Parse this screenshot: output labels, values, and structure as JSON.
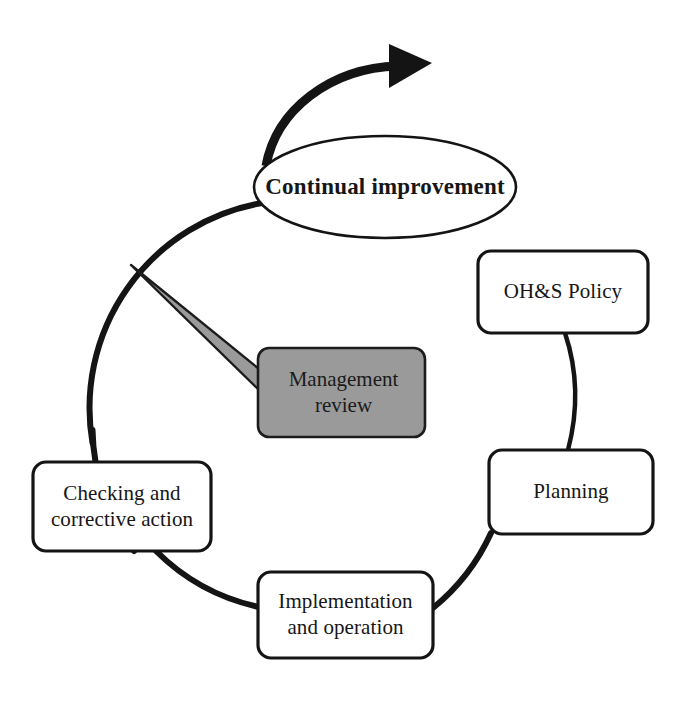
{
  "diagram": {
    "colors": {
      "stroke": "#141414",
      "box_fill": "#ffffff",
      "callout_fill": "#9a9a9a",
      "callout_stroke": "#1c1c1c",
      "page_background": "#ffffff",
      "text": "#161616"
    },
    "cycle_arrow": {
      "name": "continual-improvement-arrow",
      "direction": "clockwise"
    },
    "nodes": [
      {
        "id": "continual-improvement",
        "shape": "ellipse",
        "label": "Continual improvement",
        "emphasis": "bold",
        "x": 254,
        "y": 136,
        "width": 262,
        "height": 102
      },
      {
        "id": "ohs-policy",
        "shape": "rounded-rect",
        "label": "OH&S Policy",
        "x": 478,
        "y": 251,
        "width": 170,
        "height": 82
      },
      {
        "id": "planning",
        "shape": "rounded-rect",
        "label": "Planning",
        "x": 489,
        "y": 450,
        "width": 164,
        "height": 84
      },
      {
        "id": "implementation-and-operation",
        "shape": "rounded-rect",
        "label": "Implementation\nand operation",
        "x": 258,
        "y": 572,
        "width": 175,
        "height": 86
      },
      {
        "id": "checking-and-corrective-action",
        "shape": "rounded-rect",
        "label": "Checking and\ncorrective action",
        "x": 33,
        "y": 462,
        "width": 178,
        "height": 89
      },
      {
        "id": "management-review",
        "shape": "callout",
        "label": "Management\nreview",
        "fill": "#9a9a9a",
        "x": 258,
        "y": 348,
        "width": 167,
        "height": 89,
        "pointer_target": "cycle-ring"
      }
    ]
  }
}
